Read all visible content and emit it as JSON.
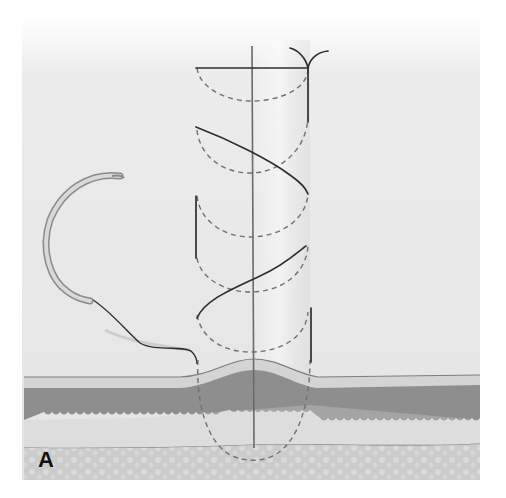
{
  "figure": {
    "panel_label": "A",
    "colors": {
      "background": "#ffffff",
      "surface": "#e6e6e6",
      "epidermis_line": "#7a7a7a",
      "epidermis": "#d6d6d6",
      "dermis": "#8c8c8c",
      "subcutis": "#c8c8c8",
      "deep_tissue": "#c2c2c2",
      "suture": "#2a2a2a",
      "needle": "#b5b5b5"
    },
    "elements": [
      "curved-needle",
      "suture-thread",
      "incision-line",
      "buried-loops",
      "knot",
      "skin-layers"
    ]
  }
}
